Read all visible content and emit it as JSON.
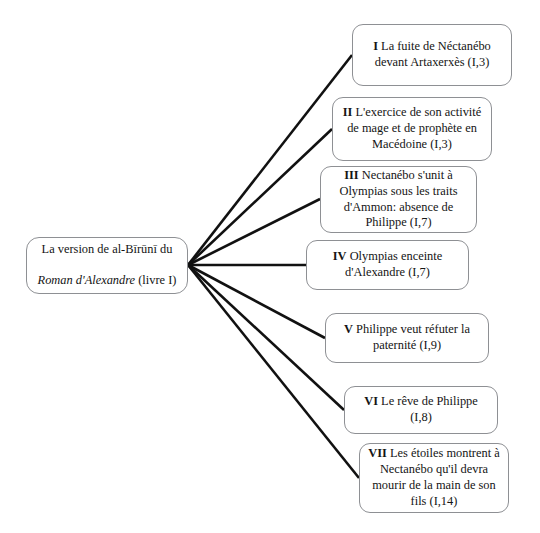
{
  "diagram": {
    "type": "tree",
    "orientation": "left-to-right",
    "background_color": "#ffffff",
    "node_border_color": "#8e9094",
    "edge_color": "#111111",
    "root": {
      "line1": "La version de al-Bīrūnī du",
      "line2_italic": "Roman d'Alexandre",
      "line2_rest": " (livre I)"
    },
    "hub": {
      "x": 188,
      "y": 265
    },
    "children": [
      {
        "numeral": "I",
        "text": " La fuite de Néctanébo\ndevant Artaxerxès (I,3)",
        "reference": "(I,3)",
        "anchor_x": 352,
        "anchor_y": 55
      },
      {
        "numeral": "II",
        "text": " L'exercice de son activité\nde mage et de prophète en\nMacédoine (I,3)",
        "reference": "(I,3)",
        "anchor_x": 332,
        "anchor_y": 129
      },
      {
        "numeral": "III",
        "text": " Nectanébo s'unit à\nOlympias sous les traits\nd'Ammon: absence de\nPhilippe (I,7)",
        "reference": "(I,7)",
        "anchor_x": 320,
        "anchor_y": 199
      },
      {
        "numeral": "IV",
        "text": " Olympias enceinte\nd'Alexandre (I,7)",
        "reference": "(I,7)",
        "anchor_x": 306,
        "anchor_y": 265
      },
      {
        "numeral": "V",
        "text": " Philippe veut réfuter la\npaternité (I,9)",
        "reference": "(I,9)",
        "anchor_x": 325,
        "anchor_y": 338
      },
      {
        "numeral": "VI",
        "text": " Le rêve de Philippe (I,8)",
        "reference": "(I,8)",
        "anchor_x": 344,
        "anchor_y": 410
      },
      {
        "numeral": "VII",
        "text": " Les étoiles montrent à\nNectanébo qu'il devra\nmourir de la main de son\nfils (I,14)",
        "reference": "(I,14)",
        "anchor_x": 359,
        "anchor_y": 478
      }
    ]
  }
}
